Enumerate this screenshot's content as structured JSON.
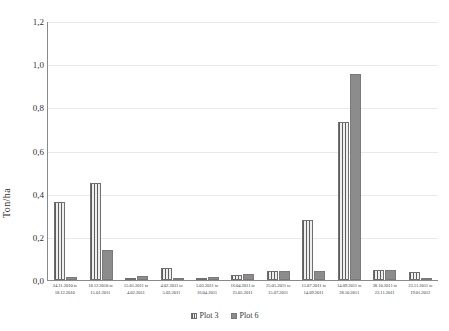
{
  "chart_data": {
    "type": "bar",
    "title": "",
    "xlabel": "",
    "ylabel": "Ton/ha",
    "ylim": [
      0,
      1.2
    ],
    "ytick_labels": [
      "1,2",
      "1,0",
      "0,8",
      "0,6",
      "0,4",
      "0,2",
      "0,0"
    ],
    "ytick_values": [
      1.2,
      1.0,
      0.8,
      0.6,
      0.4,
      0.2,
      0.0
    ],
    "grid": true,
    "legend_position": "bottom",
    "decimal_separator": ",",
    "categories": [
      "24.11.2010 to 18.12.2010",
      "18.12.2010 to 15.01.2011",
      "15.01.2011 to 4.02.2011",
      "4.02.2011 to 5.03.2011",
      "5.03.2011 to 16.04.2011",
      "16.04.2011 to 25.05.2011",
      "25.05.2011 to 15.07.2011",
      "15.07.2011 to 14.09.2011",
      "14.09.2011 to 28.10.2011",
      "28.10.2011 to 23.11.2011",
      "23.11.2011 to 19.01.2012"
    ],
    "category_lines": [
      {
        "first": "24.11.2010",
        "to": "to",
        "second": "18.12.2010"
      },
      {
        "first": "18.12.2010",
        "to": "to",
        "second": "15.01.2011"
      },
      {
        "first": "15.01.2011",
        "to": "to",
        "second": "4.02.2011"
      },
      {
        "first": "4.02.2011",
        "to": "to",
        "second": "5.03.2011"
      },
      {
        "first": "5.03.2011",
        "to": "to",
        "second": "16.04.2011"
      },
      {
        "first": "16.04.2011",
        "to": "to",
        "second": "25.05.2011"
      },
      {
        "first": "25.05.2011",
        "to": "to",
        "second": "15.07.2011"
      },
      {
        "first": "15.07.2011",
        "to": "to",
        "second": "14.09.2011"
      },
      {
        "first": "14.09.2011",
        "to": "to",
        "second": "28.10.2011"
      },
      {
        "first": "28.10.2011",
        "to": "to",
        "second": "23.11.2011"
      },
      {
        "first": "23.11.2011",
        "to": "to",
        "second": "19.01.2012"
      }
    ],
    "series": [
      {
        "name": "Plot 3",
        "fill": "striped",
        "color": "#9a9a9a",
        "values": [
          0.36,
          0.45,
          0.005,
          0.055,
          0.01,
          0.025,
          0.04,
          0.28,
          0.73,
          0.045,
          0.035
        ]
      },
      {
        "name": "Plot 6",
        "fill": "solid",
        "color": "#8c8c8c",
        "values": [
          0.015,
          0.14,
          0.02,
          0.01,
          0.015,
          0.03,
          0.04,
          0.04,
          0.955,
          0.045,
          0.008
        ]
      }
    ]
  },
  "legend": {
    "items": [
      {
        "label": "Plot 3"
      },
      {
        "label": "Plot 6"
      }
    ]
  }
}
